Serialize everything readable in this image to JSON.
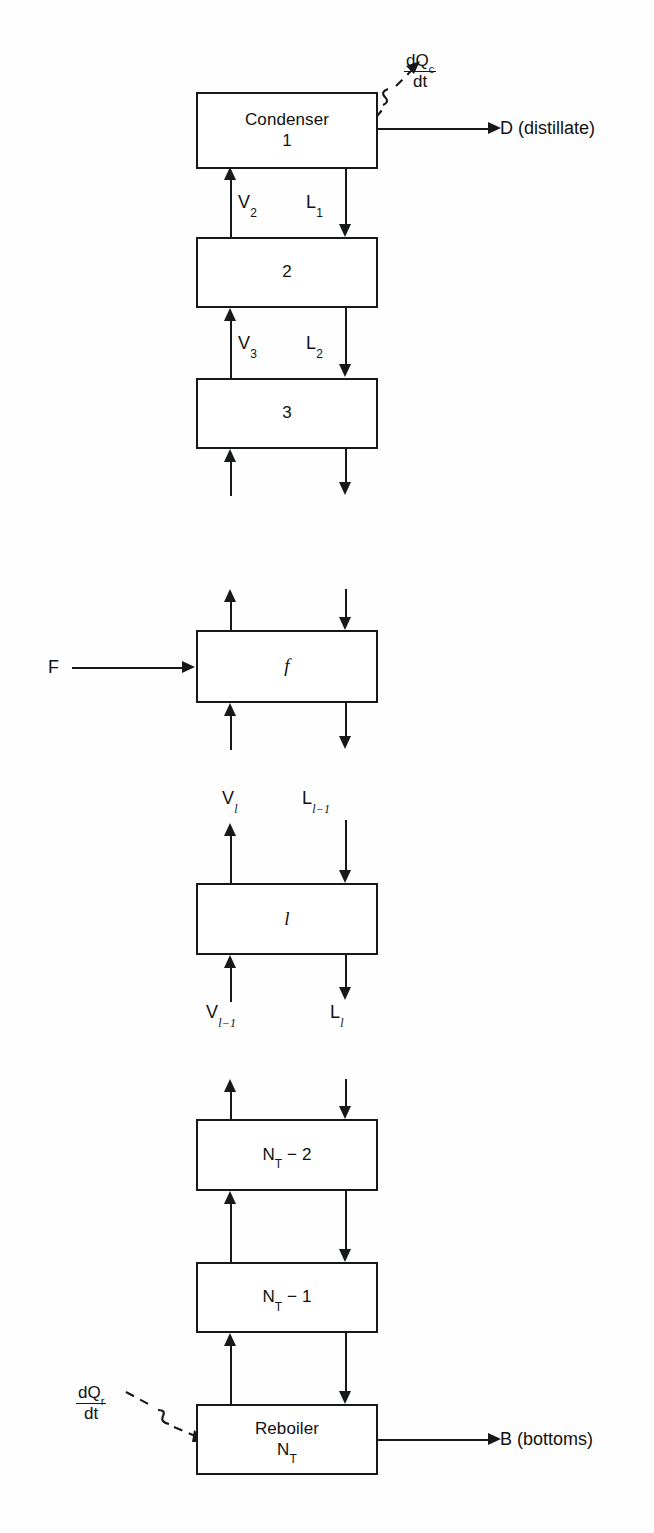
{
  "diagram": {
    "stages": [
      {
        "name": "condenser",
        "lines": [
          "Condenser",
          "1"
        ],
        "italic": [
          false,
          false
        ]
      },
      {
        "name": "stage-2",
        "lines": [
          "2"
        ],
        "italic": [
          false
        ]
      },
      {
        "name": "stage-3",
        "lines": [
          "3"
        ],
        "italic": [
          false
        ]
      },
      {
        "name": "feed-stage",
        "lines": [
          "f"
        ],
        "italic": [
          true
        ]
      },
      {
        "name": "stage-l",
        "lines": [
          "l"
        ],
        "italic": [
          true
        ]
      },
      {
        "name": "stage-nt-2",
        "lines": [
          "N_T − 2"
        ],
        "italic": [
          false
        ]
      },
      {
        "name": "stage-nt-1",
        "lines": [
          "N_T − 1"
        ],
        "italic": [
          false
        ]
      },
      {
        "name": "reboiler",
        "lines": [
          "Reboiler",
          "N_T"
        ],
        "italic": [
          false,
          false
        ]
      }
    ],
    "box_labels": {
      "condenser_line1": "Condenser",
      "condenser_line2": "1",
      "stage2": "2",
      "stage3": "3",
      "feed": "f",
      "stage_l": "l",
      "nt_minus_2_base": "N",
      "nt_minus_2_sub": "T",
      "nt_minus_2_rest": " − 2",
      "nt_minus_1_rest": " − 1",
      "reboiler_line1": "Reboiler",
      "reboiler_base": "N",
      "reboiler_sub": "T"
    },
    "streams": {
      "v2": {
        "base": "V",
        "sub": "2"
      },
      "l1": {
        "base": "L",
        "sub": "1"
      },
      "v3": {
        "base": "V",
        "sub": "3"
      },
      "l2": {
        "base": "L",
        "sub": "2"
      },
      "feed_in": "F",
      "v_l": {
        "base": "V",
        "sub": "l"
      },
      "l_l_minus_1": {
        "base": "L",
        "sub": "l−1"
      },
      "v_l_minus_1": {
        "base": "V",
        "sub": "l−1"
      },
      "l_l": {
        "base": "L",
        "sub": "l"
      },
      "distillate": "D (distillate)",
      "bottoms": "B (bottoms)"
    },
    "heat_duties": {
      "condenser": {
        "numerator_base": "dQ",
        "numerator_sub": "c",
        "denominator": "dt",
        "direction": "out"
      },
      "reboiler": {
        "numerator_base": "dQ",
        "numerator_sub": "r",
        "denominator": "dt",
        "direction": "in"
      }
    },
    "colors": {
      "ink": "#16181a",
      "page": "#fefefe",
      "box_fill": "#ffffff"
    }
  }
}
